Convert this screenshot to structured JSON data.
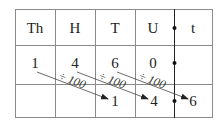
{
  "headers": [
    "Th",
    "H",
    "T",
    "U",
    "t"
  ],
  "rows": [
    [
      "1",
      "4",
      "6",
      "0",
      ""
    ],
    [
      "",
      "",
      "1",
      "4",
      "6"
    ]
  ],
  "operation": "÷ 100",
  "decimal_point_symbol": "•",
  "colors": {
    "grid": "#888888",
    "text": "#222222",
    "arrow": "#333333"
  }
}
